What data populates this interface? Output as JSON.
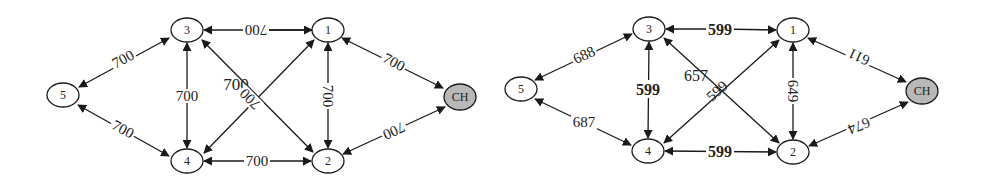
{
  "diagrams": [
    {
      "name": "left-graph",
      "nodes": [
        {
          "id": "5",
          "label": "5",
          "x": 63,
          "y": 95
        },
        {
          "id": "3",
          "label": "3",
          "x": 187,
          "y": 30
        },
        {
          "id": "4",
          "label": "4",
          "x": 187,
          "y": 161
        },
        {
          "id": "1",
          "label": "1",
          "x": 328,
          "y": 30
        },
        {
          "id": "2",
          "label": "2",
          "x": 328,
          "y": 161
        },
        {
          "id": "CH",
          "label": "CH",
          "x": 460,
          "y": 97,
          "highlight": true
        }
      ],
      "edges": [
        {
          "from": "5",
          "to": "3",
          "label": "700",
          "bidirectional": true
        },
        {
          "from": "5",
          "to": "4",
          "label": "700",
          "bidirectional": true
        },
        {
          "from": "3",
          "to": "4",
          "label": "700",
          "bidirectional": true
        },
        {
          "from": "1",
          "to": "3",
          "label": "700",
          "bidirectional": false
        },
        {
          "from": "4",
          "to": "1",
          "label": "700",
          "bidirectional": false
        },
        {
          "from": "3",
          "to": "2",
          "label": "700",
          "bidirectional": true
        },
        {
          "from": "1",
          "to": "2",
          "label": "700",
          "bidirectional": true
        },
        {
          "from": "4",
          "to": "2",
          "label": "700",
          "bidirectional": true
        },
        {
          "from": "1",
          "to": "CH",
          "label": "700",
          "bidirectional": true
        },
        {
          "from": "2",
          "to": "CH",
          "label": "700",
          "bidirectional": true
        }
      ]
    },
    {
      "name": "right-graph",
      "nodes": [
        {
          "id": "5",
          "label": "5",
          "x": 521,
          "y": 89
        },
        {
          "id": "3",
          "label": "3",
          "x": 649,
          "y": 29
        },
        {
          "id": "4",
          "label": "4",
          "x": 648,
          "y": 151
        },
        {
          "id": "1",
          "label": "1",
          "x": 793,
          "y": 30
        },
        {
          "id": "2",
          "label": "2",
          "x": 793,
          "y": 152
        },
        {
          "id": "CH",
          "label": "CH",
          "x": 922,
          "y": 91,
          "highlight": true
        }
      ],
      "edges": [
        {
          "from": "5",
          "to": "3",
          "label": "688",
          "bidirectional": true
        },
        {
          "from": "5",
          "to": "4",
          "label": "687",
          "bidirectional": true
        },
        {
          "from": "3",
          "to": "4",
          "label": "599",
          "bidirectional": true
        },
        {
          "from": "1",
          "to": "3",
          "label": "599",
          "bidirectional": false
        },
        {
          "from": "4",
          "to": "1",
          "label": "599",
          "bidirectional": true
        },
        {
          "from": "3",
          "to": "2",
          "label": "657",
          "bidirectional": true
        },
        {
          "from": "1",
          "to": "2",
          "label": "649",
          "bidirectional": true
        },
        {
          "from": "4",
          "to": "2",
          "label": "599",
          "bidirectional": true
        },
        {
          "from": "1",
          "to": "CH",
          "label": "611",
          "bidirectional": true
        },
        {
          "from": "2",
          "to": "CH",
          "label": "674",
          "bidirectional": true
        }
      ]
    }
  ],
  "colors": {
    "node_fill": "#ffffff",
    "ch_fill": "#b8b8b8",
    "stroke": "#1a1a1a"
  }
}
